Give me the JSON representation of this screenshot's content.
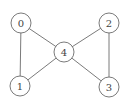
{
  "diagram": {
    "type": "graph",
    "nodes": [
      {
        "id": "0",
        "label": "0",
        "x": 21,
        "y": 23
      },
      {
        "id": "1",
        "label": "1",
        "x": 20,
        "y": 86
      },
      {
        "id": "2",
        "label": "2",
        "x": 109,
        "y": 23
      },
      {
        "id": "3",
        "label": "3",
        "x": 109,
        "y": 87
      },
      {
        "id": "4",
        "label": "4",
        "x": 64,
        "y": 52
      }
    ],
    "edges": [
      {
        "from": "0",
        "to": "1"
      },
      {
        "from": "0",
        "to": "4"
      },
      {
        "from": "1",
        "to": "4"
      },
      {
        "from": "2",
        "to": "4"
      },
      {
        "from": "2",
        "to": "3"
      },
      {
        "from": "3",
        "to": "4"
      }
    ],
    "node_radius": 10,
    "stroke_color": "#6b6b6b"
  }
}
